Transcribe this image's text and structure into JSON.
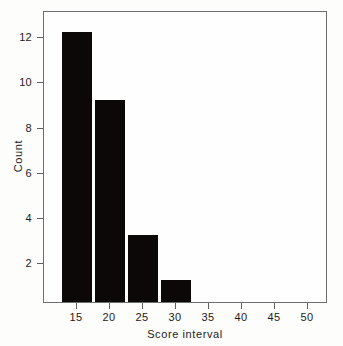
{
  "chart_data": {
    "type": "bar",
    "title": "",
    "subtitle": "",
    "xlabel": "Score interval",
    "ylabel": "Count",
    "categories": [
      "15",
      "20",
      "25",
      "30",
      "35",
      "40",
      "45",
      "50"
    ],
    "values": [
      12,
      9,
      3,
      1,
      0,
      0,
      0,
      0
    ],
    "series": [
      {
        "name": "Count",
        "values": [
          12,
          9,
          3,
          1,
          0,
          0,
          0,
          0
        ]
      }
    ],
    "x_tick_labels": [
      "15",
      "20",
      "25",
      "30",
      "35",
      "40",
      "45",
      "50"
    ],
    "y_tick_labels": [
      "2",
      "4",
      "6",
      "8",
      "10",
      "12"
    ],
    "y_tick_values": [
      2,
      4,
      6,
      8,
      10,
      12
    ],
    "ylim": [
      0,
      12.9
    ],
    "xlim": [
      12.1,
      53.5
    ],
    "grid": false,
    "legend": false,
    "legend_position": "none",
    "bar_color": "#0d0808",
    "frame_color": "#6e6e70",
    "background_color": "#fefefe",
    "annotations": []
  },
  "axes": {
    "x_title": "Score interval",
    "y_title": "Count"
  }
}
